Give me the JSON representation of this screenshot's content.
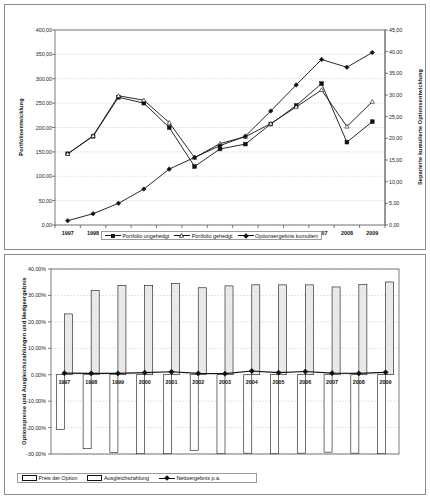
{
  "chart_data": [
    {
      "id": "portfolio-chart",
      "type": "line",
      "title": "",
      "xlabel": "",
      "ylabel": "Portfolioentwicklung",
      "y2label": "Separierte kumulierte Optionsentwicklung",
      "categories": [
        "1997",
        "1998",
        "1999",
        "2000",
        "2001",
        "2002",
        "2003",
        "2004",
        "2005",
        "2006",
        "2007",
        "2008",
        "2009"
      ],
      "ylim": [
        0,
        400
      ],
      "yticks": [
        "0,00",
        "50,00",
        "100,00",
        "150,00",
        "200,00",
        "250,00",
        "300,00",
        "350,00",
        "400,00"
      ],
      "y2lim": [
        0,
        45
      ],
      "y2ticks": [
        "0,00",
        "5,00",
        "10,00",
        "15,00",
        "20,00",
        "25,00",
        "30,00",
        "35,00",
        "40,00",
        "45,00"
      ],
      "grid": true,
      "legend_position": "bottom",
      "series": [
        {
          "name": "Portfolio ungehedgt",
          "axis": "left",
          "marker": "square-filled",
          "values": [
            146,
            182,
            262,
            250,
            200,
            120,
            156,
            166,
            207,
            245,
            290,
            170,
            212
          ]
        },
        {
          "name": "Portfolio gehedgt",
          "axis": "left",
          "marker": "triangle-open",
          "values": [
            146,
            183,
            265,
            256,
            210,
            138,
            167,
            181,
            208,
            242,
            277,
            202,
            253
          ]
        },
        {
          "name": "Optionsergebnis kumuliert",
          "axis": "right",
          "marker": "diamond-filled",
          "values": [
            1.0,
            2.6,
            5.0,
            8.3,
            12.9,
            15.6,
            18.3,
            20.5,
            26.3,
            32.3,
            38.2,
            36.4,
            39.8
          ]
        }
      ]
    },
    {
      "id": "options-chart",
      "type": "bar",
      "title": "",
      "xlabel": "",
      "ylabel": "Optionspreise und Ausgleichszahlungen und Hedgeergebnis",
      "categories": [
        "1997",
        "1998",
        "1999",
        "2000",
        "2001",
        "2002",
        "2003",
        "2004",
        "2005",
        "2006",
        "2007",
        "2008",
        "2009"
      ],
      "ylim": [
        -30,
        40
      ],
      "yticks": [
        "-30,00%",
        "-20,00%",
        "-10,00%",
        "0,00%",
        "10,00%",
        "20,00%",
        "30,00%",
        "40,00%"
      ],
      "grid": true,
      "legend_position": "bottom",
      "series": [
        {
          "name": "Preis der Option",
          "type": "bar",
          "fill": "white",
          "values": [
            -20.8,
            -28.0,
            -29.4,
            -29.9,
            -29.9,
            -28.6,
            -29.9,
            -29.7,
            -29.9,
            -29.7,
            -29.3,
            -29.7,
            -29.9
          ]
        },
        {
          "name": "Ausgleichszahlung",
          "type": "bar",
          "fill": "dotted",
          "values": [
            23.0,
            31.8,
            33.7,
            33.8,
            34.5,
            32.9,
            33.6,
            34.0,
            34.0,
            34.0,
            33.2,
            34.1,
            35.1
          ]
        },
        {
          "name": "Nettoergebnis p.a.",
          "type": "line",
          "marker": "diamond-filled",
          "values": [
            0.6,
            0.5,
            0.5,
            0.8,
            1.1,
            0.5,
            0.4,
            1.4,
            0.8,
            1.2,
            0.6,
            0.5,
            0.9
          ]
        }
      ]
    }
  ]
}
